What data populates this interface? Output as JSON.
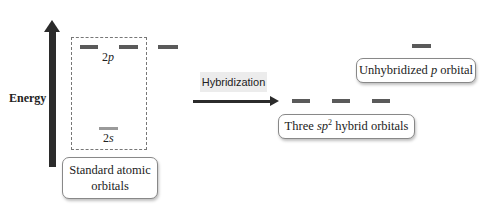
{
  "diagram": {
    "axis": {
      "label": "Energy",
      "direction": "up"
    },
    "standard_orbitals": {
      "group_label_line1": "Standard atomic",
      "group_label_line2": "orbitals",
      "levels": [
        {
          "name": "2p",
          "prefix": "2",
          "italic": "p",
          "count": 3,
          "relative_energy": "high"
        },
        {
          "name": "2s",
          "prefix": "2",
          "italic": "s",
          "count": 1,
          "relative_energy": "low"
        }
      ]
    },
    "process": {
      "label": "Hybridization"
    },
    "hybridized_orbitals": {
      "sp2": {
        "label_prefix": "Three ",
        "label_italic": "sp",
        "label_sup": "2",
        "label_suffix": " hybrid orbitals",
        "count": 3,
        "relative_energy": "middle"
      },
      "unhybridized": {
        "label_prefix": "Unhybridized ",
        "label_italic": "p",
        "label_suffix": " orbital",
        "count": 1,
        "relative_energy": "high"
      }
    },
    "colors": {
      "orbital_dark": "#5a5a5a",
      "orbital_light": "#9a9a9a",
      "arrow": "#2b2b2b",
      "process_label_bg": "#ececec"
    }
  }
}
